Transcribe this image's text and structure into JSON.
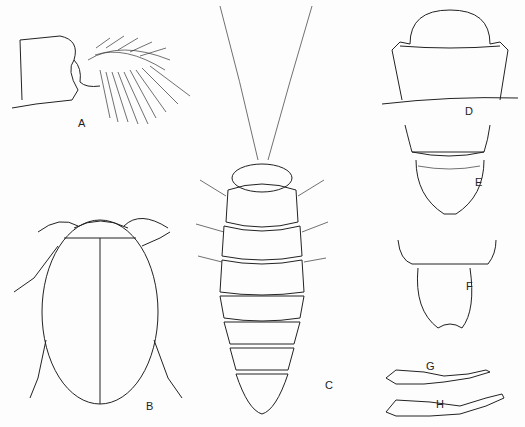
{
  "figure": {
    "labels": {
      "A": "A",
      "B": "B",
      "C": "C",
      "D": "D",
      "E": "E",
      "F": "F",
      "G": "G",
      "H": "H"
    },
    "panels": [
      {
        "id": "A",
        "subject": "gill-like appendage with branched filaments"
      },
      {
        "id": "B",
        "subject": "adult beetle, dorsal view"
      },
      {
        "id": "C",
        "subject": "larva, dorsal view"
      },
      {
        "id": "D",
        "subject": "head and pronotum outline"
      },
      {
        "id": "E",
        "subject": "terminal abdominal segment"
      },
      {
        "id": "F",
        "subject": "terminal abdominal segment, variant"
      },
      {
        "id": "G",
        "subject": "leg tarsus segments"
      },
      {
        "id": "H",
        "subject": "leg tarsus segments, variant"
      }
    ]
  }
}
